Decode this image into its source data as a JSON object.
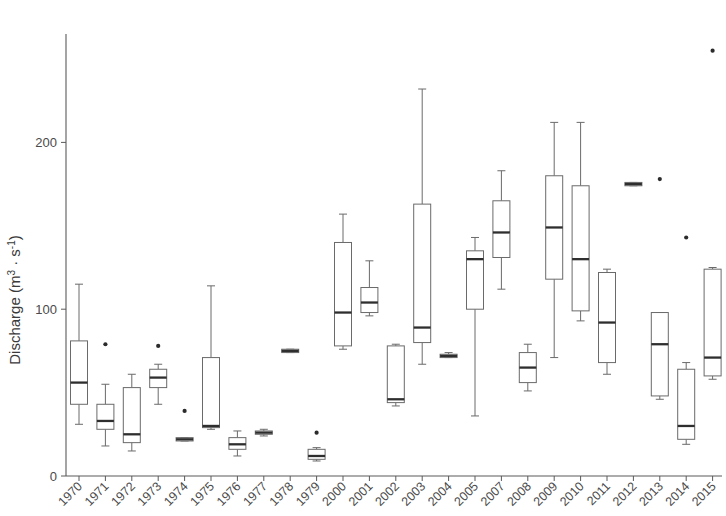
{
  "chart_data": {
    "type": "box",
    "title": "",
    "xlabel": "",
    "ylabel": "Discharge (m³ · s⁻¹)",
    "ylabel_parts": {
      "prefix": "Discharge (m",
      "sup1": "3",
      "middot": " · s",
      "sup2": "-1",
      "suffix": ")"
    },
    "ylim": [
      0,
      265
    ],
    "yticks": [
      0,
      100,
      200
    ],
    "ytick_labels": [
      "0",
      "100",
      "200"
    ],
    "grid": false,
    "legend": null,
    "categories": [
      "1970",
      "1971",
      "1972",
      "1973",
      "1974",
      "1975",
      "1976",
      "1977",
      "1978",
      "1979",
      "2000",
      "2001",
      "2002",
      "2003",
      "2004",
      "2005",
      "2007",
      "2008",
      "2009",
      "2010",
      "2011",
      "2012",
      "2013",
      "2014",
      "2015"
    ],
    "boxes": [
      {
        "category": "1970",
        "whisker_low": 31,
        "q1": 43,
        "median": 56,
        "q3": 81,
        "whisker_high": 115,
        "outliers": []
      },
      {
        "category": "1971",
        "whisker_low": 18,
        "q1": 28,
        "median": 33,
        "q3": 43,
        "whisker_high": 55,
        "outliers": [
          79
        ]
      },
      {
        "category": "1972",
        "whisker_low": 15,
        "q1": 20,
        "median": 25,
        "q3": 53,
        "whisker_high": 61,
        "outliers": []
      },
      {
        "category": "1973",
        "whisker_low": 43,
        "q1": 53,
        "median": 59,
        "q3": 64,
        "whisker_high": 67,
        "outliers": [
          78
        ]
      },
      {
        "category": "1974",
        "whisker_low": 21,
        "q1": 21,
        "median": 22,
        "q3": 23,
        "whisker_high": 23,
        "outliers": [
          39
        ]
      },
      {
        "category": "1975",
        "whisker_low": 28,
        "q1": 29,
        "median": 30,
        "q3": 71,
        "whisker_high": 114,
        "outliers": []
      },
      {
        "category": "1976",
        "whisker_low": 12,
        "q1": 16,
        "median": 19,
        "q3": 23,
        "whisker_high": 27,
        "outliers": []
      },
      {
        "category": "1977",
        "whisker_low": 24,
        "q1": 25,
        "median": 26,
        "q3": 27,
        "whisker_high": 28,
        "outliers": []
      },
      {
        "category": "1978",
        "whisker_low": 74,
        "q1": 74,
        "median": 75,
        "q3": 76,
        "whisker_high": 76,
        "outliers": []
      },
      {
        "category": "1979",
        "whisker_low": 9,
        "q1": 10,
        "median": 12,
        "q3": 16,
        "whisker_high": 17,
        "outliers": [
          26
        ]
      },
      {
        "category": "2000",
        "whisker_low": 76,
        "q1": 78,
        "median": 98,
        "q3": 140,
        "whisker_high": 157,
        "outliers": []
      },
      {
        "category": "2001",
        "whisker_low": 96,
        "q1": 98,
        "median": 104,
        "q3": 113,
        "whisker_high": 129,
        "outliers": []
      },
      {
        "category": "2002",
        "whisker_low": 42,
        "q1": 44,
        "median": 46,
        "q3": 78,
        "whisker_high": 79,
        "outliers": []
      },
      {
        "category": "2003",
        "whisker_low": 67,
        "q1": 80,
        "median": 89,
        "q3": 163,
        "whisker_high": 232,
        "outliers": []
      },
      {
        "category": "2004",
        "whisker_low": 71,
        "q1": 71,
        "median": 72,
        "q3": 73,
        "whisker_high": 74,
        "outliers": []
      },
      {
        "category": "2005",
        "whisker_low": 36,
        "q1": 100,
        "median": 130,
        "q3": 135,
        "whisker_high": 143,
        "outliers": []
      },
      {
        "category": "2007",
        "whisker_low": 112,
        "q1": 131,
        "median": 146,
        "q3": 165,
        "whisker_high": 183,
        "outliers": []
      },
      {
        "category": "2008",
        "whisker_low": 51,
        "q1": 56,
        "median": 65,
        "q3": 74,
        "whisker_high": 79,
        "outliers": []
      },
      {
        "category": "2009",
        "whisker_low": 71,
        "q1": 118,
        "median": 149,
        "q3": 180,
        "whisker_high": 212,
        "outliers": []
      },
      {
        "category": "2010",
        "whisker_low": 93,
        "q1": 99,
        "median": 130,
        "q3": 174,
        "whisker_high": 212,
        "outliers": []
      },
      {
        "category": "2011",
        "whisker_low": 61,
        "q1": 68,
        "median": 92,
        "q3": 122,
        "whisker_high": 124,
        "outliers": []
      },
      {
        "category": "2012",
        "whisker_low": 174,
        "q1": 174,
        "median": 175,
        "q3": 176,
        "whisker_high": 176,
        "outliers": []
      },
      {
        "category": "2013",
        "whisker_low": 46,
        "q1": 48,
        "median": 79,
        "q3": 98,
        "whisker_high": 98,
        "outliers": [
          178
        ]
      },
      {
        "category": "2014",
        "whisker_low": 19,
        "q1": 22,
        "median": 30,
        "q3": 64,
        "whisker_high": 68,
        "outliers": [
          143
        ]
      },
      {
        "category": "2015",
        "whisker_low": 58,
        "q1": 60,
        "median": 71,
        "q3": 124,
        "whisker_high": 125,
        "outliers": [
          255
        ]
      }
    ]
  },
  "colors": {
    "axis": "#5a5a5a",
    "box_stroke": "#6a6a6a",
    "median": "#2e2e2e",
    "outlier": "#2b2b2b",
    "background": "#ffffff"
  },
  "geometry": {
    "plot_left": 66,
    "plot_right": 722,
    "plot_top": 10,
    "plot_bottom": 476,
    "y_zero_px": 476,
    "y_per_unit_px": 1.668,
    "first_tick_x": 79,
    "tick_spacing": 26.4,
    "box_width": 17
  }
}
